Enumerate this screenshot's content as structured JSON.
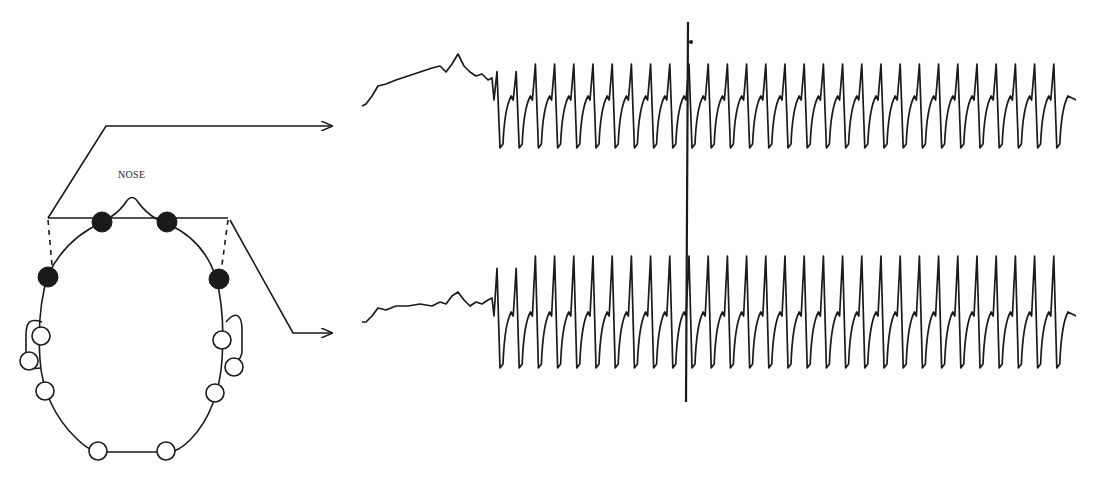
{
  "figure": {
    "head_label": "NOSE",
    "ink_color": "#1a1a1a",
    "background": "#ffffff"
  },
  "head_diagram": {
    "active_electrodes": 4,
    "inactive_electrodes": 8,
    "active_electrode_positions": [
      "left-frontal",
      "right-frontal",
      "left-anterior-temporal",
      "right-anterior-temporal"
    ],
    "inactive_electrode_positions": [
      "left-temporal",
      "left-ear",
      "left-posterior-temporal",
      "left-occipital",
      "right-occipital",
      "right-posterior-temporal",
      "right-ear",
      "right-temporal"
    ]
  },
  "channels": [
    {
      "name": "channel-top",
      "target": "left derivation (upper trace)",
      "baseline_segment": "slow irregular activity",
      "ictal_segment": "rhythmic spike-and-wave discharges",
      "spike_count_approx": 34
    },
    {
      "name": "channel-bottom",
      "target": "right derivation (lower trace)",
      "baseline_segment": "slow irregular activity",
      "ictal_segment": "rhythmic spike-and-wave discharges",
      "spike_count_approx": 34
    }
  ],
  "marker": {
    "type": "vertical event marker",
    "x_px": 688
  }
}
